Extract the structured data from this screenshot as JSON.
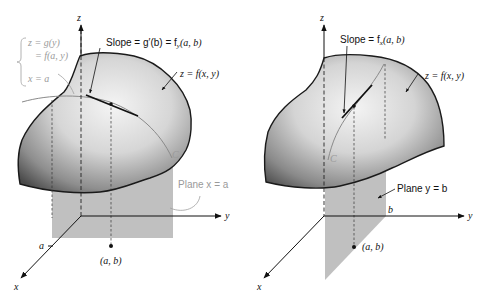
{
  "figure": {
    "left_panel": {
      "axes": {
        "z": "z",
        "y": "y",
        "x": "x"
      },
      "curve_definition": {
        "line1": "z = g(y)",
        "line2": "= f(a, y)",
        "line3": "x = a"
      },
      "slope_label": "Slope = g′(b) = f",
      "slope_subscript": "y",
      "slope_args": "(a, b)",
      "surface_label": "z = f(x, y)",
      "curve_symbol": "C",
      "plane_label": "Plane x = a",
      "tick_a": "a",
      "point_label": "(a, b)"
    },
    "right_panel": {
      "axes": {
        "z": "z",
        "y": "y",
        "x": "x"
      },
      "slope_label": "Slope = f",
      "slope_subscript": "x",
      "slope_args": "(a, b)",
      "surface_label": "z = f(x, y)",
      "curve_symbol": "C",
      "plane_label": "Plane y = b",
      "tick_b": "b",
      "point_label": "(a, b)"
    },
    "colors": {
      "plane_fill": "#bdbdbd",
      "surface_light": "#efefef",
      "surface_dark": "#5a5a5a",
      "ink": "#111111",
      "annotation_gray": "#9a9a9a"
    }
  }
}
